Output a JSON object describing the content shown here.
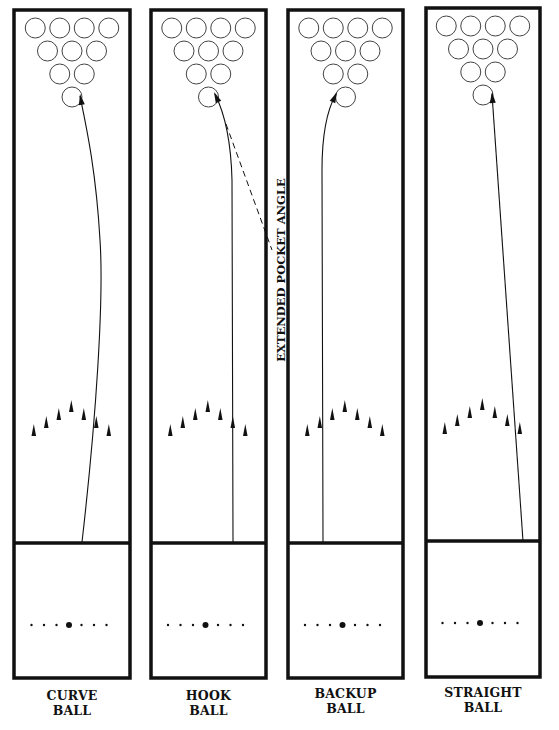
{
  "diagram": {
    "colors": {
      "ink": "#111111",
      "background": "#ffffff"
    },
    "annotation": {
      "text": "EXTENDED POCKET ANGLE",
      "orientation": "vertical-bottom-to-top"
    },
    "lanes": [
      {
        "id": "curve",
        "label_line1": "CURVE",
        "label_line2": "BALL",
        "box": {
          "x": 14,
          "top": 10,
          "width": 116,
          "foul_y": 543,
          "bottom": 678
        },
        "path": "M 82 542 C 96 420, 104 300, 100 240 C 96 170, 86 125, 80 96",
        "arrow_tip": [
          80,
          94
        ],
        "arrow_dir": [
          -0.17,
          -1
        ]
      },
      {
        "id": "hook",
        "label_line1": "HOOK",
        "label_line2": "BALL",
        "box": {
          "x": 151,
          "top": 10,
          "width": 115,
          "foul_y": 543,
          "bottom": 678
        },
        "path": "M 233 542 L 232 180 C 231 140, 224 112, 215 94",
        "arrow_tip": [
          214,
          92
        ],
        "arrow_dir": [
          -0.45,
          -1
        ],
        "dashed": {
          "x1": 226,
          "y1": 124,
          "x2": 272,
          "y2": 250
        }
      },
      {
        "id": "backup",
        "label_line1": "BACKUP",
        "label_line2": "BALL",
        "box": {
          "x": 288,
          "top": 10,
          "width": 115,
          "foul_y": 543,
          "bottom": 678
        },
        "path": "M 323 542 L 322 170 C 322 135, 327 110, 336 94",
        "arrow_tip": [
          337,
          92
        ],
        "arrow_dir": [
          0.45,
          -1
        ]
      },
      {
        "id": "straight",
        "label_line1": "STRAIGHT",
        "label_line2": "BALL",
        "box": {
          "x": 426,
          "top": 8,
          "width": 114,
          "foul_y": 541,
          "bottom": 677
        },
        "path": "M 523 541 L 492 94",
        "arrow_tip": [
          492,
          92
        ],
        "arrow_dir": [
          -0.07,
          -1
        ]
      }
    ],
    "pins": {
      "count_per_lane": 10,
      "rows": [
        4,
        3,
        2,
        1
      ],
      "radius": 10
    },
    "lane_arrows": {
      "count_per_lane": 7
    },
    "approach_dots": {
      "count_per_lane": 7,
      "center_dot": "large"
    }
  }
}
